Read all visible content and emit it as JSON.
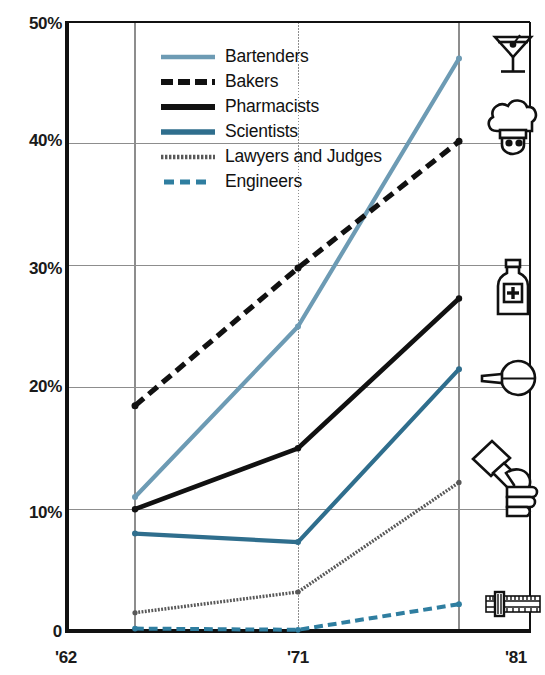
{
  "chart_data": {
    "type": "line",
    "title": "",
    "subtitle": "",
    "xlabel": "",
    "ylabel": "",
    "x": [
      "'62",
      "'71",
      "'81"
    ],
    "x_tick_labels": [
      "'62",
      "'71",
      "'81"
    ],
    "y_tick_labels": [
      "50%",
      "40%",
      "30%",
      "20%",
      "10%",
      "0"
    ],
    "y_ticks": [
      50,
      40,
      30,
      20,
      10,
      0
    ],
    "ylim": [
      0,
      50
    ],
    "grid": "horizontal-and-vertical",
    "legend_position": "top-center-inside",
    "series": [
      {
        "name": "Bartenders",
        "color": "#6d9bb4",
        "style": "solid",
        "values": [
          11.0,
          25.0,
          47.0
        ],
        "icon": "martini-glass-icon"
      },
      {
        "name": "Bakers",
        "color": "#111111",
        "style": "dashed",
        "values": [
          18.5,
          29.8,
          40.2
        ],
        "icon": "chef-hat-icon"
      },
      {
        "name": "Pharmacists",
        "color": "#111111",
        "style": "solid",
        "values": [
          10.0,
          15.0,
          27.3
        ],
        "icon": "medicine-bottle-icon"
      },
      {
        "name": "Scientists",
        "color": "#2f6e8d",
        "style": "solid",
        "values": [
          8.0,
          7.3,
          21.5
        ],
        "icon": "flask-icon"
      },
      {
        "name": "Lawyers and Judges",
        "color": "#585858",
        "style": "dotted",
        "values": [
          1.5,
          3.2,
          12.2
        ],
        "icon": "gavel-icon"
      },
      {
        "name": "Engineers",
        "color": "#2f7ea0",
        "style": "dashed",
        "values": [
          0.2,
          0.1,
          2.2
        ],
        "icon": "slide-rule-icon"
      }
    ]
  },
  "axes": {
    "y": [
      {
        "label": "50%",
        "value": 50
      },
      {
        "label": "40%",
        "value": 40
      },
      {
        "label": "30%",
        "value": 30
      },
      {
        "label": "20%",
        "value": 20
      },
      {
        "label": "10%",
        "value": 10
      },
      {
        "label": "0",
        "value": 0
      }
    ],
    "x": [
      {
        "label": "'62"
      },
      {
        "label": "'71"
      },
      {
        "label": "'81"
      }
    ]
  },
  "legend": {
    "items": [
      {
        "label": "Bartenders"
      },
      {
        "label": "Bakers"
      },
      {
        "label": "Pharmacists"
      },
      {
        "label": "Scientists"
      },
      {
        "label": "Lawyers and Judges"
      },
      {
        "label": "Engineers"
      }
    ]
  },
  "icons": [
    {
      "name": "martini-glass-icon"
    },
    {
      "name": "chef-hat-icon"
    },
    {
      "name": "medicine-bottle-icon"
    },
    {
      "name": "flask-icon"
    },
    {
      "name": "gavel-icon"
    },
    {
      "name": "slide-rule-icon"
    }
  ],
  "colors": {
    "bartenders": "#6d9bb4",
    "bakers": "#111111",
    "pharmacists": "#111111",
    "scientists": "#2f6e8d",
    "lawyers": "#585858",
    "engineers": "#2f7ea0",
    "grid": "#8d8d8d",
    "frame": "#111111",
    "background": "#ffffff"
  }
}
